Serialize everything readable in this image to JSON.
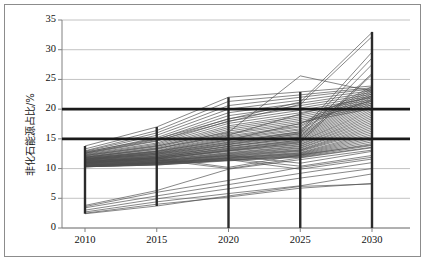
{
  "chart_data": {
    "type": "line",
    "title": "",
    "subtitle": "",
    "xlabel": "",
    "ylabel": "非化石能源占比/%",
    "x": [
      2010,
      2015,
      2020,
      2025,
      2030
    ],
    "xtick_labels": [
      "2010",
      "2015",
      "2020",
      "2025",
      "2030"
    ],
    "ytick_labels": [
      "0",
      "5",
      "10",
      "15",
      "20",
      "25",
      "30",
      "35"
    ],
    "yticks": [
      0,
      5,
      10,
      15,
      20,
      25,
      30,
      35
    ],
    "ylim": [
      0,
      35
    ],
    "xlim": [
      2008,
      2032
    ],
    "grid": "horizontal",
    "legend": "none",
    "line_color": "#4d4d4d",
    "reference_line_color": "#1a1a1a",
    "grid_color": "#b3b3b3",
    "axis_color": "#808080",
    "reference_lines": [
      {
        "label": "20",
        "value": 20,
        "orientation": "horizontal",
        "style": "thick"
      },
      {
        "label": "15",
        "value": 15,
        "orientation": "horizontal",
        "style": "thick"
      }
    ],
    "range_bars": [
      {
        "x": 2010,
        "low": 2.4,
        "high": 13.8
      },
      {
        "x": 2015,
        "low": 3.7,
        "high": 17.0
      },
      {
        "x": 2020,
        "low": 0.0,
        "high": 22.0
      },
      {
        "x": 2025,
        "low": 0.0,
        "high": 22.9
      },
      {
        "x": 2030,
        "low": 0.0,
        "high": 33.0
      }
    ],
    "series": [
      {
        "name": "S01",
        "values": [
          13.8,
          17.0,
          22.0,
          22.9,
          23.9
        ]
      },
      {
        "name": "S02",
        "values": [
          13.3,
          16.4,
          21.3,
          22.4,
          23.6
        ]
      },
      {
        "name": "S03",
        "values": [
          13.0,
          16.0,
          20.6,
          22.0,
          23.4
        ]
      },
      {
        "name": "S04",
        "values": [
          12.9,
          15.6,
          20.0,
          21.5,
          23.1
        ]
      },
      {
        "name": "S05",
        "values": [
          12.7,
          15.2,
          19.4,
          21.0,
          22.8
        ]
      },
      {
        "name": "S06",
        "values": [
          12.6,
          14.9,
          18.9,
          20.6,
          22.5
        ]
      },
      {
        "name": "S07",
        "values": [
          12.5,
          14.6,
          18.4,
          20.2,
          22.2
        ]
      },
      {
        "name": "S08",
        "values": [
          12.4,
          14.3,
          18.0,
          19.8,
          21.9
        ]
      },
      {
        "name": "S09",
        "values": [
          12.3,
          14.1,
          17.6,
          19.4,
          21.6
        ]
      },
      {
        "name": "S10",
        "values": [
          12.2,
          13.9,
          17.2,
          19.0,
          21.3
        ]
      },
      {
        "name": "S11",
        "values": [
          12.1,
          13.7,
          16.9,
          18.7,
          21.0
        ]
      },
      {
        "name": "S12",
        "values": [
          12.0,
          13.5,
          16.6,
          18.4,
          20.7
        ]
      },
      {
        "name": "S13",
        "values": [
          11.9,
          13.3,
          16.3,
          18.1,
          20.4
        ]
      },
      {
        "name": "S14",
        "values": [
          11.9,
          13.2,
          16.0,
          17.8,
          20.1
        ]
      },
      {
        "name": "S15",
        "values": [
          11.8,
          13.0,
          15.8,
          17.5,
          23.8
        ]
      },
      {
        "name": "S16",
        "values": [
          11.8,
          12.9,
          15.5,
          17.2,
          23.5
        ]
      },
      {
        "name": "S17",
        "values": [
          11.7,
          12.8,
          15.3,
          17.0,
          23.2
        ]
      },
      {
        "name": "S18",
        "values": [
          11.7,
          12.7,
          15.1,
          16.7,
          22.9
        ]
      },
      {
        "name": "S19",
        "values": [
          11.6,
          12.6,
          14.9,
          16.5,
          22.6
        ]
      },
      {
        "name": "S20",
        "values": [
          11.6,
          12.5,
          14.7,
          16.2,
          22.3
        ]
      },
      {
        "name": "S21",
        "values": [
          11.5,
          12.4,
          14.5,
          16.0,
          22.0
        ]
      },
      {
        "name": "S22",
        "values": [
          11.5,
          12.3,
          14.3,
          15.8,
          21.7
        ]
      },
      {
        "name": "S23",
        "values": [
          11.4,
          12.2,
          14.1,
          15.6,
          21.4
        ]
      },
      {
        "name": "S24",
        "values": [
          11.4,
          12.1,
          14.0,
          15.4,
          21.1
        ]
      },
      {
        "name": "S25",
        "values": [
          11.3,
          12.0,
          13.8,
          15.2,
          20.8
        ]
      },
      {
        "name": "S26",
        "values": [
          11.3,
          11.9,
          13.7,
          15.0,
          20.5
        ]
      },
      {
        "name": "S27",
        "values": [
          11.2,
          11.8,
          13.5,
          14.8,
          20.2
        ]
      },
      {
        "name": "S28",
        "values": [
          11.2,
          11.8,
          13.4,
          14.6,
          19.9
        ]
      },
      {
        "name": "S29",
        "values": [
          11.1,
          11.7,
          13.2,
          14.5,
          19.6
        ]
      },
      {
        "name": "S30",
        "values": [
          11.1,
          11.6,
          13.1,
          14.3,
          19.3
        ]
      },
      {
        "name": "S31",
        "values": [
          11.0,
          11.6,
          13.0,
          14.1,
          19.0
        ]
      },
      {
        "name": "S32",
        "values": [
          11.0,
          11.5,
          12.9,
          14.0,
          18.7
        ]
      },
      {
        "name": "S33",
        "values": [
          10.9,
          11.4,
          12.7,
          13.8,
          18.4
        ]
      },
      {
        "name": "S34",
        "values": [
          10.9,
          11.4,
          12.6,
          13.7,
          18.1
        ]
      },
      {
        "name": "S35",
        "values": [
          10.8,
          11.3,
          12.5,
          13.5,
          17.8
        ]
      },
      {
        "name": "S36",
        "values": [
          10.8,
          11.2,
          12.4,
          13.4,
          17.5
        ]
      },
      {
        "name": "S37",
        "values": [
          10.7,
          11.2,
          12.3,
          13.2,
          17.2
        ]
      },
      {
        "name": "S38",
        "values": [
          10.7,
          11.1,
          12.2,
          13.1,
          16.9
        ]
      },
      {
        "name": "S39",
        "values": [
          10.6,
          11.1,
          12.1,
          13.0,
          16.6
        ]
      },
      {
        "name": "S40",
        "values": [
          10.6,
          11.0,
          12.0,
          12.9,
          16.3
        ]
      },
      {
        "name": "S41",
        "values": [
          10.5,
          11.0,
          11.9,
          12.7,
          16.0
        ]
      },
      {
        "name": "S42",
        "values": [
          10.5,
          10.9,
          11.8,
          12.6,
          15.7
        ]
      },
      {
        "name": "S43",
        "values": [
          10.4,
          10.9,
          11.8,
          12.5,
          15.4
        ]
      },
      {
        "name": "S44",
        "values": [
          10.4,
          10.8,
          11.7,
          12.4,
          15.1
        ]
      },
      {
        "name": "S45",
        "values": [
          10.4,
          10.8,
          11.6,
          12.3,
          14.8
        ]
      },
      {
        "name": "S46",
        "values": [
          10.3,
          10.7,
          11.5,
          12.2,
          14.5
        ]
      },
      {
        "name": "S47",
        "values": [
          10.3,
          10.7,
          11.4,
          12.1,
          14.2
        ]
      },
      {
        "name": "S48",
        "values": [
          10.3,
          10.6,
          11.4,
          12.0,
          13.9
        ]
      },
      {
        "name": "S49",
        "values": [
          10.3,
          10.6,
          11.3,
          11.9,
          13.6
        ]
      },
      {
        "name": "S50",
        "values": [
          12.8,
          15.0,
          18.3,
          21.2,
          32.9
        ]
      },
      {
        "name": "S51",
        "values": [
          12.6,
          14.7,
          17.9,
          20.8,
          32.2
        ]
      },
      {
        "name": "S52",
        "values": [
          11.5,
          12.6,
          14.4,
          16.2,
          29.6
        ]
      },
      {
        "name": "S53",
        "values": [
          11.4,
          12.4,
          14.1,
          15.9,
          28.6
        ]
      },
      {
        "name": "S54",
        "values": [
          11.2,
          12.1,
          13.7,
          15.3,
          27.5
        ]
      },
      {
        "name": "S55",
        "values": [
          11.0,
          11.9,
          13.3,
          14.8,
          26.0
        ]
      },
      {
        "name": "S56",
        "values": [
          10.9,
          11.7,
          13.0,
          14.4,
          25.8
        ]
      },
      {
        "name": "S57",
        "values": [
          12.2,
          13.8,
          16.1,
          25.6,
          23.0
        ]
      },
      {
        "name": "S58",
        "values": [
          11.9,
          13.4,
          15.6,
          19.2,
          22.1
        ]
      },
      {
        "name": "S59",
        "values": [
          11.6,
          12.9,
          14.8,
          17.6,
          21.5
        ]
      },
      {
        "name": "S60",
        "values": [
          10.8,
          11.3,
          12.2,
          10.9,
          12.9
        ]
      },
      {
        "name": "S61",
        "values": [
          10.6,
          11.0,
          11.7,
          10.4,
          12.2
        ]
      },
      {
        "name": "S62",
        "values": [
          10.5,
          10.9,
          11.5,
          9.9,
          11.6
        ]
      },
      {
        "name": "S63",
        "values": [
          11.0,
          11.5,
          10.0,
          11.8,
          13.5
        ]
      },
      {
        "name": "S64",
        "values": [
          11.2,
          11.8,
          10.2,
          12.3,
          14.0
        ]
      },
      {
        "name": "S65",
        "values": [
          3.8,
          6.3,
          9.9,
          11.5,
          13.1
        ]
      },
      {
        "name": "S66",
        "values": [
          3.6,
          6.0,
          8.0,
          10.2,
          11.9
        ]
      },
      {
        "name": "S67",
        "values": [
          3.4,
          5.4,
          7.3,
          9.2,
          11.0
        ]
      },
      {
        "name": "S68",
        "values": [
          3.0,
          4.9,
          6.6,
          8.4,
          10.0
        ]
      },
      {
        "name": "S69",
        "values": [
          2.7,
          4.4,
          5.8,
          7.1,
          9.1
        ]
      },
      {
        "name": "S70",
        "values": [
          2.5,
          4.0,
          5.2,
          6.7,
          7.5
        ]
      },
      {
        "name": "S71",
        "values": [
          2.4,
          3.7,
          5.4,
          7.0,
          7.4
        ]
      }
    ],
    "marker_years": [
      2010,
      2015,
      2020,
      2025,
      2030
    ]
  }
}
